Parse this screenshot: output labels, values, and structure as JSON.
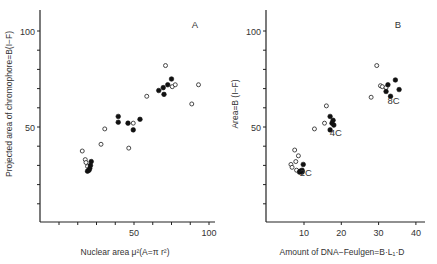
{
  "chart_data": [
    {
      "type": "scatter",
      "panel_label": "A",
      "title": "",
      "xlabel": "Nuclear area μ²(A=π r²)",
      "ylabel": "Projected area of chromophore=B(I−F)",
      "xlim": [
        -12.5,
        100
      ],
      "ylim": [
        0,
        110
      ],
      "xticks": [
        0,
        12.5,
        25,
        37.5,
        50,
        62.5,
        75,
        87.5,
        100
      ],
      "xtick_labels": {
        "50": "50",
        "100": "100"
      },
      "yticks": [
        10,
        20,
        30,
        40,
        50,
        60,
        70,
        80,
        90,
        100
      ],
      "ytick_labels": {
        "50": "50",
        "100": "100"
      },
      "grid": false,
      "legend": "none",
      "series": [
        {
          "name": "open circles",
          "marker": "open",
          "points": [
            [
              15.5,
              37.5
            ],
            [
              17.5,
              33.0
            ],
            [
              18.0,
              31.5
            ],
            [
              19.0,
              29.5
            ],
            [
              28.0,
              41.0
            ],
            [
              30.5,
              49.0
            ],
            [
              46.5,
              39.0
            ],
            [
              49.5,
              52.0
            ],
            [
              58.5,
              66.0
            ],
            [
              71.0,
              82.0
            ],
            [
              75.5,
              71.0
            ],
            [
              77.5,
              72.0
            ],
            [
              93.0,
              72.0
            ],
            [
              88.5,
              62.0
            ]
          ]
        },
        {
          "name": "filled circles",
          "marker": "filled",
          "points": [
            [
              19.0,
              27.0
            ],
            [
              20.0,
              27.5
            ],
            [
              20.5,
              28.5
            ],
            [
              21.0,
              30.0
            ],
            [
              21.5,
              32.0
            ],
            [
              39.5,
              55.5
            ],
            [
              39.5,
              52.5
            ],
            [
              46.0,
              52.0
            ],
            [
              49.5,
              48.5
            ],
            [
              54.0,
              54.0
            ],
            [
              66.5,
              69.0
            ],
            [
              69.5,
              70.5
            ],
            [
              70.0,
              67.0
            ],
            [
              72.5,
              72.0
            ],
            [
              75.0,
              75.0
            ]
          ]
        }
      ]
    },
    {
      "type": "scatter",
      "panel_label": "B",
      "title": "",
      "xlabel": "Amount of DNA−Feulgen=B·L₁·D",
      "ylabel": "Area=B (I−F)",
      "xlim": [
        0,
        42
      ],
      "ylim": [
        0,
        110
      ],
      "xticks": [
        10,
        20,
        30,
        40
      ],
      "xtick_labels": {
        "10": "10",
        "20": "20",
        "30": "30",
        "40": "40"
      },
      "yticks": [
        10,
        20,
        30,
        40,
        50,
        60,
        70,
        80,
        90,
        100
      ],
      "ytick_labels": {
        "50": "50",
        "100": "100"
      },
      "grid": false,
      "legend": "none",
      "annotations": [
        {
          "text": "2C",
          "x": 10.5,
          "y": 24.5
        },
        {
          "text": "4C",
          "x": 18.5,
          "y": 45.5
        },
        {
          "text": "8C",
          "x": 34.0,
          "y": 62.0
        }
      ],
      "series": [
        {
          "name": "open circles",
          "marker": "open",
          "points": [
            [
              7.5,
              38.0
            ],
            [
              8.5,
              35.0
            ],
            [
              7.8,
              32.0
            ],
            [
              6.5,
              30.5
            ],
            [
              6.8,
              29.0
            ],
            [
              8.0,
              27.5
            ],
            [
              16.0,
              61.0
            ],
            [
              15.5,
              52.0
            ],
            [
              12.8,
              49.0
            ],
            [
              29.5,
              82.0
            ],
            [
              30.5,
              71.5
            ],
            [
              31.0,
              71.0
            ],
            [
              32.0,
              70.5
            ],
            [
              28.0,
              65.5
            ]
          ]
        },
        {
          "name": "filled circles",
          "marker": "filled",
          "points": [
            [
              9.8,
              30.5
            ],
            [
              9.0,
              27.0
            ],
            [
              9.5,
              26.5
            ],
            [
              8.8,
              26.5
            ],
            [
              9.5,
              27.5
            ],
            [
              17.0,
              55.5
            ],
            [
              17.8,
              53.5
            ],
            [
              17.5,
              52.0
            ],
            [
              18.0,
              51.0
            ],
            [
              17.0,
              48.5
            ],
            [
              34.5,
              74.5
            ],
            [
              32.5,
              72.0
            ],
            [
              35.5,
              69.5
            ],
            [
              32.0,
              68.5
            ],
            [
              33.2,
              66.0
            ]
          ]
        }
      ]
    }
  ]
}
